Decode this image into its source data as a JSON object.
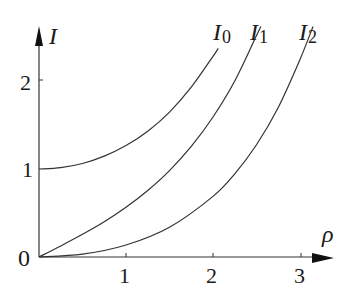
{
  "chart_data": {
    "type": "line",
    "title": "",
    "xlabel": "ρ",
    "ylabel": "I",
    "xlim": [
      0,
      3.3
    ],
    "ylim": [
      0,
      2.4
    ],
    "x_ticks": [
      "1",
      "2",
      "3"
    ],
    "y_ticks": [
      "1",
      "2"
    ],
    "origin_label": "0",
    "grid": false,
    "legend": "inline labels at curve ends",
    "series": [
      {
        "name": "I0",
        "label_main": "I",
        "label_sub": "0",
        "x": [
          0,
          0.25,
          0.5,
          0.75,
          1.0,
          1.25,
          1.5,
          1.75,
          2.0,
          2.06
        ],
        "values": [
          1.0,
          1.016,
          1.063,
          1.146,
          1.266,
          1.429,
          1.647,
          1.93,
          2.28,
          2.37
        ]
      },
      {
        "name": "I1",
        "label_main": "I",
        "label_sub": "1",
        "x": [
          0,
          0.25,
          0.5,
          0.75,
          1.0,
          1.25,
          1.5,
          1.75,
          2.0,
          2.25,
          2.5,
          2.55
        ],
        "values": [
          0,
          0.126,
          0.258,
          0.401,
          0.565,
          0.756,
          0.982,
          1.256,
          1.591,
          2.0,
          2.517,
          2.62
        ]
      },
      {
        "name": "I2",
        "label_main": "I",
        "label_sub": "2",
        "x": [
          0,
          0.5,
          1.0,
          1.5,
          2.0,
          2.25,
          2.5,
          2.75,
          3.0,
          3.15
        ],
        "values": [
          0,
          0.032,
          0.136,
          0.338,
          0.689,
          0.945,
          1.276,
          1.7,
          2.245,
          2.62
        ]
      }
    ]
  },
  "labels": {
    "y_axis": "I",
    "x_axis": "ρ",
    "origin": "0",
    "xt1": "1",
    "xt2": "2",
    "xt3": "3",
    "yt1": "1",
    "yt2": "2",
    "I": "I",
    "s0": "0",
    "s1": "1",
    "s2": "2"
  }
}
